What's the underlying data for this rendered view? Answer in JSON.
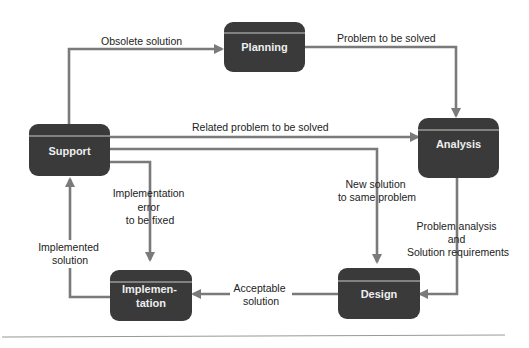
{
  "diagram": {
    "nodes": {
      "planning": {
        "label": "Planning"
      },
      "analysis": {
        "label": "Analysis"
      },
      "support": {
        "label": "Support"
      },
      "design": {
        "label": "Design"
      },
      "implementation": {
        "label_line1": "Implemen-",
        "label_line2": "tation"
      }
    },
    "edges": {
      "obsolete": {
        "from": "Support",
        "to": "Planning",
        "label": "Obsolete solution"
      },
      "problem_to_solve": {
        "from": "Planning",
        "to": "Analysis",
        "label": "Problem to be solved"
      },
      "related_problem": {
        "from": "Support",
        "to": "Analysis",
        "label": "Related problem to be solved"
      },
      "new_solution": {
        "from": "Support",
        "to": "Design",
        "label_line1": "New solution",
        "label_line2": "to same problem"
      },
      "impl_error": {
        "from": "Support",
        "to": "Implementation",
        "label_line1": "Implementation",
        "label_line2": "error",
        "label_line3": "to be fixed"
      },
      "analysis_to_design": {
        "from": "Analysis",
        "to": "Design",
        "label_line1": "Problem analysis",
        "label_line2": "and",
        "label_line3": "Solution requirements"
      },
      "acceptable": {
        "from": "Design",
        "to": "Implementation",
        "label_line1": "Acceptable",
        "label_line2": "solution"
      },
      "implemented": {
        "from": "Implementation",
        "to": "Support",
        "label_line1": "Implemented",
        "label_line2": "solution"
      }
    },
    "colors": {
      "node_fill": "#3a3a3a",
      "node_text": "#eeeeee",
      "edge": "#7a7a7a",
      "label_text": "#222222"
    }
  }
}
